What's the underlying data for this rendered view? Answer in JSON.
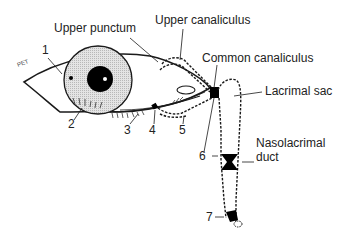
{
  "labels": {
    "upper_punctum": "Upper punctum",
    "upper_canaliculus": "Upper canaliculus",
    "common_canaliculus": "Common canaliculus",
    "lacrimal_sac": "Lacrimal sac",
    "nasolacrimal_duct_line1": "Nasolacrimal",
    "nasolacrimal_duct_line2": "duct"
  },
  "numbers": [
    "1",
    "2",
    "3",
    "4",
    "5",
    "6",
    "7"
  ],
  "signature": "PET",
  "colors": {
    "line": "#1a1a1a",
    "iris_fill": "#d0d0d0",
    "pupil": "#000000",
    "background": "#ffffff"
  }
}
